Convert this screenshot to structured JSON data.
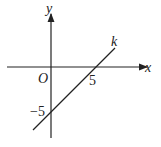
{
  "diagram": {
    "x_axis_label": "x",
    "y_axis_label": "y",
    "origin_label": "O",
    "line_label": "k",
    "x_intercept_label": "5",
    "y_intercept_label": "−5",
    "colors": {
      "stroke": "#222222",
      "background": "#ffffff"
    }
  }
}
